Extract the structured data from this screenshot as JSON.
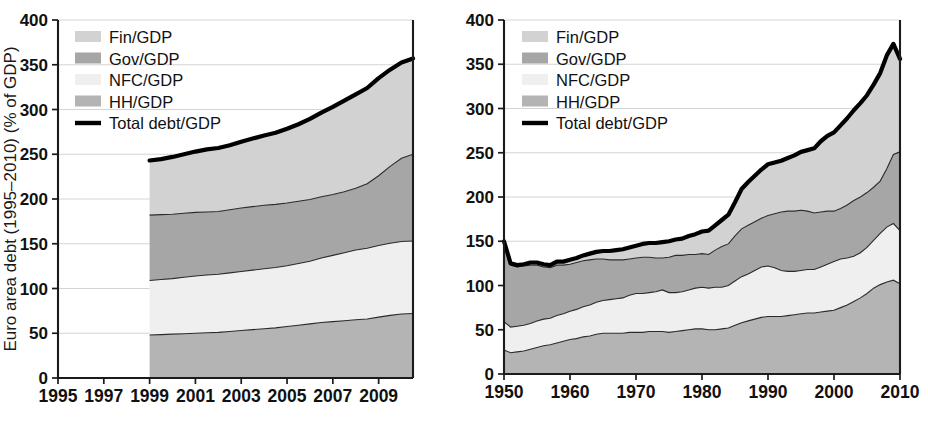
{
  "figure": {
    "panel_count": 2,
    "background": "#ffffff"
  },
  "colors": {
    "fin": "#d2d2d2",
    "gov": "#a6a6a6",
    "nfc": "#efefef",
    "hh": "#b4b4b4",
    "total_line": "#000000",
    "axis": "#1b1b1b",
    "grid": "#cfcfcf",
    "text": "#111111"
  },
  "legend": {
    "position": "top-left",
    "entries": [
      {
        "label": "Fin/GDP",
        "swatch": "#d2d2d2",
        "type": "area"
      },
      {
        "label": "Gov/GDP",
        "swatch": "#a6a6a6",
        "type": "area"
      },
      {
        "label": "NFC/GDP",
        "swatch": "#efefef",
        "type": "area"
      },
      {
        "label": "HH/GDP",
        "swatch": "#b4b4b4",
        "type": "area"
      },
      {
        "label": "Total debt/GDP",
        "swatch": "#000000",
        "type": "line"
      }
    ]
  },
  "chart_data": [
    {
      "id": "euro-area-debt",
      "type": "area",
      "stacked": true,
      "title": "",
      "ylabel": "Euro area debt (1995–2010) (% of GDP)",
      "xlabel": "",
      "xlim": [
        1995,
        2010.5
      ],
      "ylim": [
        0,
        400
      ],
      "yticks": [
        0,
        50,
        100,
        150,
        200,
        250,
        300,
        350,
        400
      ],
      "xticks": [
        1995,
        1997,
        1999,
        2001,
        2003,
        2005,
        2007,
        2009
      ],
      "xtick_labels": [
        "1995",
        "1997",
        "1999",
        "2001",
        "2003",
        "2005",
        "2007",
        "2009"
      ],
      "ytick_labels": [
        "0",
        "50",
        "100",
        "150",
        "200",
        "250",
        "300",
        "350",
        "400"
      ],
      "grid": true,
      "grid_axis": "y",
      "data_start_x": 1999,
      "x": [
        1999,
        1999.5,
        2000,
        2000.5,
        2001,
        2001.5,
        2002,
        2002.5,
        2003,
        2003.5,
        2004,
        2004.5,
        2005,
        2005.5,
        2006,
        2006.5,
        2007,
        2007.5,
        2008,
        2008.5,
        2009,
        2009.5,
        2010,
        2010.5
      ],
      "series": [
        {
          "name": "HH/GDP",
          "color": "#b4b4b4",
          "values": [
            48,
            48.5,
            49,
            49.5,
            50,
            50.5,
            51,
            52,
            53,
            54,
            55,
            56,
            57.5,
            59,
            60.5,
            62,
            63,
            64,
            65,
            66,
            68,
            70,
            71.5,
            72
          ]
        },
        {
          "name": "NFC/GDP",
          "color": "#efefef",
          "values": [
            61,
            61.5,
            62,
            63,
            64,
            64.5,
            65,
            65.5,
            66,
            66.5,
            67,
            67.5,
            68,
            69,
            70,
            72,
            74,
            76,
            78,
            79,
            80,
            80.5,
            81,
            81
          ]
        },
        {
          "name": "Gov/GDP",
          "color": "#a6a6a6",
          "values": [
            73,
            72.5,
            72,
            71.5,
            71,
            70.5,
            70,
            70.5,
            71,
            71,
            71,
            70.5,
            70,
            69.5,
            69,
            68.5,
            68,
            68,
            69,
            72,
            78,
            86,
            93,
            97
          ]
        },
        {
          "name": "Fin/GDP",
          "color": "#d2d2d2",
          "values": [
            61,
            62,
            64,
            66,
            68,
            70,
            71,
            72,
            74,
            76,
            78,
            80,
            83,
            86,
            90,
            94,
            98,
            102,
            105,
            107,
            109,
            108,
            107,
            107
          ]
        }
      ],
      "total_series": {
        "name": "Total debt/GDP",
        "color": "#000000",
        "values": [
          243,
          244.5,
          247,
          250,
          253,
          255.5,
          257,
          260,
          264,
          267.5,
          271,
          274,
          278.5,
          283.5,
          289.5,
          296.5,
          303,
          310,
          317,
          324,
          335,
          344.5,
          352.5,
          357
        ]
      }
    },
    {
      "id": "us-debt",
      "type": "area",
      "stacked": true,
      "title": "",
      "ylabel": "US debt (1950–2010) (in % of GDP)",
      "xlabel": "",
      "xlim": [
        1950,
        2010
      ],
      "ylim": [
        0,
        400
      ],
      "yticks": [
        0,
        50,
        100,
        150,
        200,
        250,
        300,
        350,
        400
      ],
      "xticks": [
        1950,
        1960,
        1970,
        1980,
        1990,
        2000,
        2010
      ],
      "xtick_labels": [
        "1950",
        "1960",
        "1970",
        "1980",
        "1990",
        "2000",
        "2010"
      ],
      "ytick_labels": [
        "0",
        "50",
        "100",
        "150",
        "200",
        "250",
        "300",
        "350",
        "400"
      ],
      "grid": true,
      "grid_axis": "y",
      "data_start_x": 1950,
      "x": [
        1950,
        1951,
        1952,
        1953,
        1954,
        1955,
        1956,
        1957,
        1958,
        1959,
        1960,
        1961,
        1962,
        1963,
        1964,
        1965,
        1966,
        1967,
        1968,
        1969,
        1970,
        1971,
        1972,
        1973,
        1974,
        1975,
        1976,
        1977,
        1978,
        1979,
        1980,
        1981,
        1982,
        1983,
        1984,
        1985,
        1986,
        1987,
        1988,
        1989,
        1990,
        1991,
        1992,
        1993,
        1994,
        1995,
        1996,
        1997,
        1998,
        1999,
        2000,
        2001,
        2002,
        2003,
        2004,
        2005,
        2006,
        2007,
        2008,
        2009,
        2010
      ],
      "series": [
        {
          "name": "HH/GDP",
          "color": "#b4b4b4",
          "values": [
            27,
            24,
            25,
            26,
            28,
            30,
            32,
            33,
            35,
            37,
            39,
            40,
            42,
            43,
            45,
            46,
            46,
            46,
            46,
            47,
            47,
            47,
            48,
            48,
            48,
            47,
            48,
            49,
            50,
            51,
            51,
            50,
            50,
            51,
            52,
            55,
            58,
            60,
            62,
            64,
            65,
            65,
            65,
            66,
            67,
            68,
            69,
            69,
            70,
            71,
            72,
            75,
            78,
            82,
            86,
            91,
            97,
            101,
            104,
            106,
            102
          ]
        },
        {
          "name": "NFC/GDP",
          "color": "#efefef",
          "values": [
            32,
            29,
            29,
            29,
            29,
            30,
            30,
            30,
            31,
            31,
            32,
            33,
            34,
            35,
            36,
            37,
            38,
            39,
            40,
            42,
            44,
            44,
            44,
            45,
            47,
            45,
            44,
            44,
            45,
            46,
            47,
            47,
            48,
            47,
            48,
            50,
            52,
            53,
            55,
            57,
            57,
            55,
            52,
            50,
            49,
            49,
            49,
            49,
            51,
            53,
            55,
            55,
            53,
            51,
            51,
            52,
            54,
            58,
            62,
            64,
            60
          ]
        },
        {
          "name": "Gov/GDP",
          "color": "#a6a6a6",
          "values": [
            90,
            70,
            67,
            67,
            66,
            63,
            59,
            57,
            57,
            55,
            53,
            53,
            52,
            51,
            49,
            47,
            45,
            44,
            43,
            41,
            40,
            41,
            40,
            38,
            36,
            40,
            42,
            41,
            40,
            38,
            38,
            38,
            42,
            46,
            47,
            51,
            54,
            55,
            55,
            55,
            57,
            61,
            66,
            68,
            68,
            68,
            66,
            64,
            62,
            60,
            57,
            57,
            60,
            63,
            63,
            62,
            60,
            59,
            66,
            78,
            89
          ]
        },
        {
          "name": "Fin/GDP",
          "color": "#d2d2d2",
          "values": [
            1,
            2,
            2,
            2,
            3,
            3,
            3,
            3,
            4,
            4,
            5,
            5,
            6,
            7,
            8,
            9,
            10,
            11,
            12,
            13,
            14,
            15,
            16,
            17,
            18,
            18,
            18,
            19,
            21,
            23,
            25,
            27,
            28,
            30,
            33,
            38,
            45,
            49,
            52,
            55,
            58,
            58,
            58,
            60,
            63,
            66,
            69,
            73,
            80,
            85,
            89,
            94,
            98,
            102,
            106,
            110,
            116,
            122,
            128,
            125,
            105
          ]
        }
      ],
      "total_series": {
        "name": "Total debt/GDP",
        "color": "#000000",
        "values": [
          150,
          125,
          123,
          124,
          126,
          126,
          124,
          123,
          127,
          127,
          129,
          131,
          134,
          136,
          138,
          139,
          139,
          140,
          141,
          143,
          145,
          147,
          148,
          148,
          149,
          150,
          152,
          153,
          156,
          158,
          161,
          162,
          168,
          174,
          180,
          194,
          209,
          217,
          224,
          231,
          237,
          239,
          241,
          244,
          247,
          251,
          253,
          255,
          263,
          269,
          273,
          281,
          289,
          298,
          306,
          315,
          327,
          340,
          360,
          373,
          356
        ]
      }
    }
  ]
}
